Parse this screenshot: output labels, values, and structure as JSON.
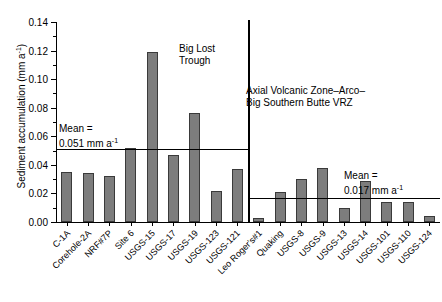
{
  "chart_data": {
    "type": "bar",
    "title": "",
    "xlabel": "",
    "ylabel": "Sediment accumulation (mm a",
    "ylabel_sup": "-1",
    "ylabel_tail": ")",
    "ylim": [
      0.0,
      0.14
    ],
    "ytick_labels": [
      "0.00",
      "0.02",
      "0.04",
      "0.06",
      "0.08",
      "0.10",
      "0.12",
      "0.14"
    ],
    "ytick_values": [
      0.0,
      0.02,
      0.04,
      0.06,
      0.08,
      0.1,
      0.12,
      0.14
    ],
    "yminor_values": [
      0.01,
      0.03,
      0.05,
      0.07,
      0.09,
      0.11,
      0.13
    ],
    "grid": false,
    "legend": "none",
    "bar_color": "#7d7d7d",
    "bar_edge_color": "#3a3a3a",
    "categories": [
      "C-1A",
      "Corehole-2A",
      "NRF#7P",
      "Site 6",
      "USGS-15",
      "USGS-17",
      "USGS-19",
      "USGS-123",
      "USGS-121",
      "Leo Roger's#1",
      "Quaking",
      "USGS-8",
      "USGS-9",
      "USGS-13",
      "USGS-14",
      "USGS-101",
      "USGS-110",
      "USGS-124"
    ],
    "values": [
      0.035,
      0.034,
      0.032,
      0.052,
      0.119,
      0.047,
      0.076,
      0.022,
      0.037,
      0.003,
      0.021,
      0.03,
      0.038,
      0.01,
      0.029,
      0.014,
      0.014,
      0.004
    ],
    "groups": [
      {
        "name": "Big Lost Trough",
        "annotation_lines": [
          "Big Lost",
          "Trough"
        ],
        "start_index": 0,
        "end_index": 8,
        "mean": 0.051,
        "mean_label_lines": [
          "Mean =",
          "0.051 mm a"
        ],
        "mean_label_sup": "-1"
      },
      {
        "name": "Axial Volcanic Zone-Arco-Big Southern Butte VRZ",
        "annotation_lines": [
          "Axial Volcanic Zone–Arco–",
          "Big Southern Butte VRZ"
        ],
        "start_index": 9,
        "end_index": 17,
        "mean": 0.017,
        "mean_label_lines": [
          "Mean =",
          "0.017 mm a"
        ],
        "mean_label_sup": "-1"
      }
    ]
  }
}
